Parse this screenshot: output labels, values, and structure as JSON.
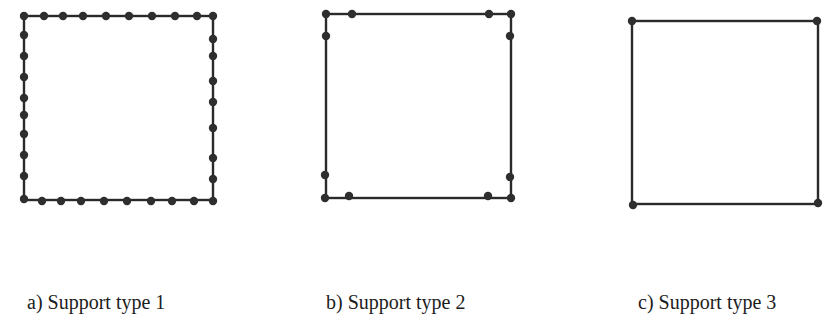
{
  "figure": {
    "panels": [
      {
        "id": "a",
        "label": "a) Support type 1",
        "square": {
          "x1": 24,
          "y1": 16,
          "x2": 213,
          "y2": 200
        },
        "supports": [
          [
            24,
            16
          ],
          [
            44,
            16
          ],
          [
            63,
            16
          ],
          [
            83,
            16
          ],
          [
            106,
            16
          ],
          [
            129,
            16
          ],
          [
            152,
            16
          ],
          [
            175,
            16
          ],
          [
            197,
            16
          ],
          [
            213,
            16
          ],
          [
            24,
            35
          ],
          [
            24,
            56
          ],
          [
            24,
            77
          ],
          [
            24,
            98
          ],
          [
            24,
            115
          ],
          [
            24,
            134
          ],
          [
            24,
            155
          ],
          [
            24,
            176
          ],
          [
            213,
            39
          ],
          [
            213,
            56
          ],
          [
            213,
            81
          ],
          [
            213,
            102
          ],
          [
            213,
            128
          ],
          [
            213,
            158
          ],
          [
            213,
            179
          ],
          [
            24,
            199
          ],
          [
            42,
            201
          ],
          [
            61,
            201
          ],
          [
            81,
            201
          ],
          [
            104,
            201
          ],
          [
            127,
            201
          ],
          [
            151,
            201
          ],
          [
            172,
            201
          ],
          [
            194,
            201
          ],
          [
            213,
            201
          ]
        ]
      },
      {
        "id": "b",
        "label": "b) Support type 2",
        "square": {
          "x1": 326,
          "y1": 14,
          "x2": 511,
          "y2": 198
        },
        "supports": [
          [
            326,
            14
          ],
          [
            352,
            14
          ],
          [
            489,
            14
          ],
          [
            511,
            14
          ],
          [
            326,
            36
          ],
          [
            510,
            36
          ],
          [
            325,
            175
          ],
          [
            510,
            177
          ],
          [
            325,
            198
          ],
          [
            349,
            196
          ],
          [
            488,
            196
          ],
          [
            511,
            198
          ]
        ]
      },
      {
        "id": "c",
        "label": "c) Support type 3",
        "square": {
          "x1": 632,
          "y1": 21,
          "x2": 818,
          "y2": 204
        },
        "supports": [
          [
            632,
            21
          ],
          [
            817,
            21
          ],
          [
            633,
            205
          ],
          [
            818,
            203
          ]
        ]
      }
    ],
    "style": {
      "line_color": "#2a2a2a",
      "support_color": "#2e2e2e",
      "line_width": 2.4,
      "support_radius": 4.2
    }
  }
}
